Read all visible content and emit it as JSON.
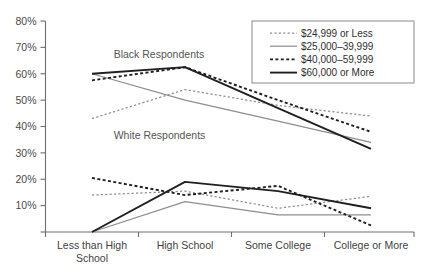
{
  "chart_data": {
    "type": "line",
    "title": "",
    "xlabel": "",
    "ylabel": "",
    "categories": [
      "Less than High School",
      "High School",
      "Some College",
      "College or More"
    ],
    "ylim": [
      0,
      80
    ],
    "yticks": [
      0,
      10,
      20,
      30,
      40,
      50,
      60,
      70,
      80
    ],
    "ytick_labels": [
      "",
      "10%",
      "20%",
      "30%",
      "40%",
      "50%",
      "60%",
      "70%",
      "80%"
    ],
    "grid": false,
    "legend_position": "top-right",
    "legend_entries": [
      "$24,999 or Less",
      "$25,000–39,999",
      "$40,000–59,999",
      "$60,000 or More"
    ],
    "group_annotations": [
      {
        "label": "Black Respondents",
        "x_pct": 18.5,
        "y_pct": 17.5
      },
      {
        "label": "White Respondents",
        "x_pct": 18.5,
        "y_pct": 56.0
      }
    ],
    "groups": [
      {
        "name": "Black Respondents",
        "series": [
          {
            "name": "$24,999 or Less",
            "style": "fine-dash",
            "values": [
              43.0,
              54.0,
              48.0,
              44.0
            ]
          },
          {
            "name": "$25,000–39,999",
            "style": "thin-solid",
            "values": [
              60.0,
              50.0,
              42.0,
              34.0
            ]
          },
          {
            "name": "$40,000–59,999",
            "style": "bold-dash",
            "values": [
              57.5,
              62.5,
              50.0,
              38.0
            ]
          },
          {
            "name": "$60,000 or More",
            "style": "bold-solid",
            "values": [
              60.0,
              62.5,
              47.0,
              31.5
            ]
          }
        ]
      },
      {
        "name": "White Respondents",
        "series": [
          {
            "name": "$24,999 or Less",
            "style": "fine-dash",
            "values": [
              14.0,
              15.5,
              9.0,
              13.5
            ]
          },
          {
            "name": "$25,000–39,999",
            "style": "thin-solid",
            "values": [
              0.0,
              11.5,
              6.5,
              6.5
            ]
          },
          {
            "name": "$40,000–59,999",
            "style": "bold-dash",
            "values": [
              20.5,
              14.0,
              17.5,
              2.5
            ]
          },
          {
            "name": "$60,000 or More",
            "style": "bold-solid",
            "values": [
              0.0,
              19.0,
              15.5,
              9.0
            ]
          }
        ]
      }
    ]
  }
}
